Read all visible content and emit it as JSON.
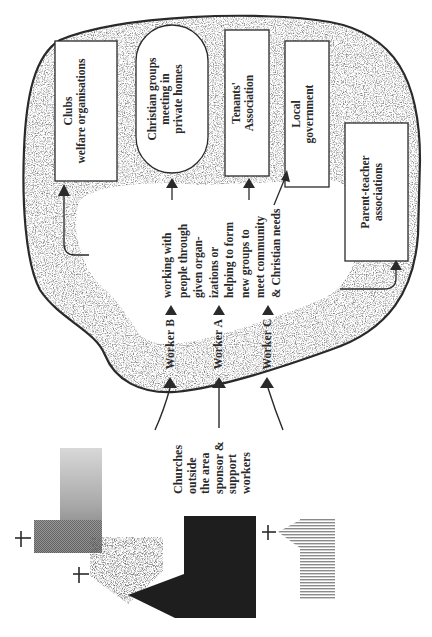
{
  "diagram": {
    "orientation": "rotated -90deg (text reads bottom-to-top)",
    "community_area": {
      "organisations": [
        {
          "id": "clubs",
          "label": "Clubs\nwelfare organisations",
          "shape": "rectangle"
        },
        {
          "id": "christian-groups",
          "label": "Christian groups\nmeeting in\nprivate homes",
          "shape": "rounded-pill"
        },
        {
          "id": "tenants",
          "label": "Tenants'\nAssociation",
          "shape": "rectangle"
        },
        {
          "id": "local-gov",
          "label": "Local\ngovernment",
          "shape": "rectangle"
        },
        {
          "id": "pta",
          "label": "Parent-teacher\nassociations",
          "shape": "rectangle"
        }
      ],
      "description": "working with\npeople through\ngiven organ-\nizations or\nhelping to form\nnew groups to\nmeet community\n& Christian needs",
      "workers": [
        {
          "id": "worker-b",
          "label": "Worker B"
        },
        {
          "id": "worker-a",
          "label": "Worker A"
        },
        {
          "id": "worker-c",
          "label": "Worker C"
        }
      ]
    },
    "sponsor_label": "Churches\noutside\nthe area\nsponsor &\nsupport\nworkers",
    "church_symbols": [
      {
        "id": "church-grey-gradient",
        "fill": "gradient grey",
        "cross": "+"
      },
      {
        "id": "church-speckled",
        "fill": "speckled",
        "cross": "+"
      },
      {
        "id": "church-black",
        "fill": "solid dark",
        "cross": ""
      },
      {
        "id": "church-striped",
        "fill": "horizontal stripes",
        "cross": "+"
      }
    ],
    "colors": {
      "ink": "#2a2a2a",
      "speckle": "#3a3a3a",
      "paper": "#ffffff",
      "dark_church": "#1e1e1e",
      "stripe": "#8a8a8a"
    }
  }
}
